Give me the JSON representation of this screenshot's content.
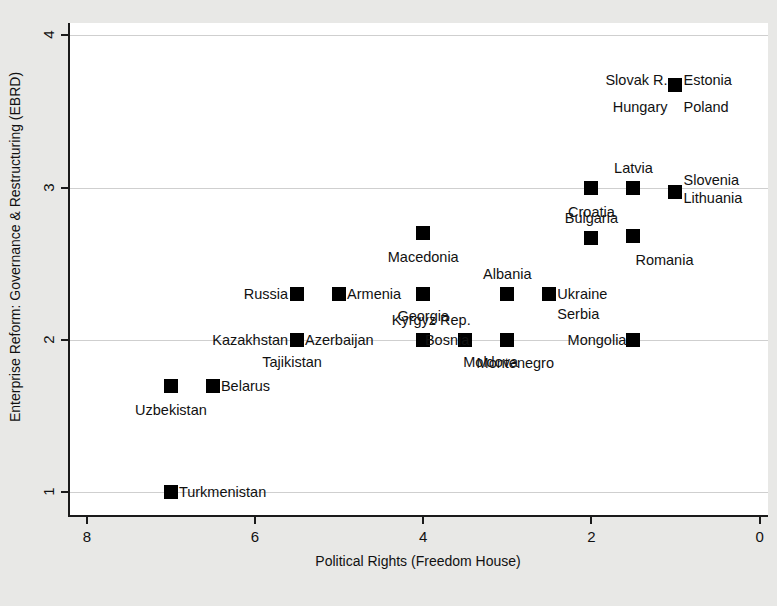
{
  "chart_data": {
    "type": "scatter",
    "title": "",
    "xlabel": "Political Rights (Freedom House)",
    "ylabel": "Enterprise Reform: Governance & Restructuring (EBRD)",
    "xlim": [
      8.2,
      -0.1
    ],
    "ylim": [
      0.85,
      4.08
    ],
    "x_reversed": true,
    "xticks": [
      8,
      6,
      4,
      2,
      0
    ],
    "xtick_labels": [
      "8",
      "6",
      "4",
      "2",
      "0"
    ],
    "yticks": [
      1,
      2,
      3,
      4
    ],
    "ytick_labels": [
      "1",
      "2",
      "3",
      "4"
    ],
    "grid": true,
    "grid_axis": "y",
    "legend": "none",
    "marker_shape": "square",
    "marker_color": "#000000",
    "points": [
      {
        "label": "",
        "x": 1.0,
        "y": 3.67,
        "labels_around": [
          {
            "text": "Slovak R.",
            "pos": "left",
            "dx": -8,
            "dy": -5
          },
          {
            "text": "Estonia",
            "pos": "right",
            "dx": 8,
            "dy": -5
          },
          {
            "text": "Hungary",
            "pos": "left",
            "dx": -8,
            "dy": 22
          },
          {
            "text": "Poland",
            "pos": "right",
            "dx": 8,
            "dy": 22
          }
        ]
      },
      {
        "label": "",
        "x": 2.0,
        "y": 3.0,
        "labels_around": [
          {
            "text": "Croatia",
            "pos": "center",
            "dx": 0,
            "dy": 24
          }
        ]
      },
      {
        "label": "",
        "x": 1.5,
        "y": 3.0,
        "labels_around": [
          {
            "text": "Latvia",
            "pos": "center",
            "dx": 0,
            "dy": -20
          }
        ]
      },
      {
        "label": "",
        "x": 1.0,
        "y": 2.97,
        "labels_around": [
          {
            "text": "Slovenia",
            "pos": "right",
            "dx": 8,
            "dy": -12
          },
          {
            "text": "Lithuania",
            "pos": "right",
            "dx": 8,
            "dy": 6
          }
        ]
      },
      {
        "label": "",
        "x": 2.0,
        "y": 2.67,
        "labels_around": [
          {
            "text": "Bulgaria",
            "pos": "center",
            "dx": 0,
            "dy": -20
          }
        ]
      },
      {
        "label": "",
        "x": 1.5,
        "y": 2.68,
        "labels_around": [
          {
            "text": "Romania",
            "pos": "right",
            "dx": 2,
            "dy": 24
          }
        ]
      },
      {
        "label": "",
        "x": 4.0,
        "y": 2.7,
        "labels_around": [
          {
            "text": "Macedonia",
            "pos": "center",
            "dx": 0,
            "dy": 24
          }
        ]
      },
      {
        "label": "",
        "x": 5.5,
        "y": 2.3,
        "labels_around": [
          {
            "text": "Russia",
            "pos": "left",
            "dx": -9,
            "dy": 0
          }
        ]
      },
      {
        "label": "",
        "x": 5.0,
        "y": 2.3,
        "labels_around": [
          {
            "text": "Armenia",
            "pos": "right",
            "dx": 8,
            "dy": 0
          }
        ]
      },
      {
        "label": "",
        "x": 4.0,
        "y": 2.3,
        "labels_around": [
          {
            "text": "Georgia",
            "pos": "center",
            "dx": 0,
            "dy": 22
          }
        ]
      },
      {
        "label": "",
        "x": 3.0,
        "y": 2.3,
        "labels_around": [
          {
            "text": "Albania",
            "pos": "center",
            "dx": 0,
            "dy": -20
          }
        ]
      },
      {
        "label": "",
        "x": 2.5,
        "y": 2.3,
        "labels_around": [
          {
            "text": "Ukraine",
            "pos": "right",
            "dx": 8,
            "dy": 0
          },
          {
            "text": "Serbia",
            "pos": "right",
            "dx": 8,
            "dy": 20
          }
        ]
      },
      {
        "label": "",
        "x": 5.5,
        "y": 2.0,
        "labels_around": [
          {
            "text": "Kazakhstan",
            "pos": "left",
            "dx": -9,
            "dy": 0
          },
          {
            "text": "Azerbaijan",
            "pos": "right",
            "dx": 8,
            "dy": 0
          },
          {
            "text": "Tajikistan",
            "pos": "center",
            "dx": -5,
            "dy": 22
          }
        ]
      },
      {
        "label": "",
        "x": 4.0,
        "y": 2.0,
        "labels_around": [
          {
            "text": "Kyrgyz Rep.",
            "pos": "center",
            "dx": 8,
            "dy": -20
          }
        ]
      },
      {
        "label": "",
        "x": 3.5,
        "y": 2.0,
        "labels_around": [
          {
            "text": "Bosnia",
            "pos": "left",
            "dx": 4,
            "dy": 0
          },
          {
            "text": "Moldova",
            "pos": "right",
            "dx": -2,
            "dy": 22
          }
        ]
      },
      {
        "label": "",
        "x": 3.0,
        "y": 2.0,
        "labels_around": [
          {
            "text": "Montenegro",
            "pos": "center",
            "dx": 8,
            "dy": 23
          }
        ]
      },
      {
        "label": "",
        "x": 1.5,
        "y": 2.0,
        "labels_around": [
          {
            "text": "Mongolia",
            "pos": "left",
            "dx": -7,
            "dy": 0
          }
        ]
      },
      {
        "label": "",
        "x": 7.0,
        "y": 1.7,
        "labels_around": [
          {
            "text": "Uzbekistan",
            "pos": "center",
            "dx": 0,
            "dy": 24
          }
        ]
      },
      {
        "label": "",
        "x": 6.5,
        "y": 1.7,
        "labels_around": [
          {
            "text": "Belarus",
            "pos": "right",
            "dx": 8,
            "dy": 0
          }
        ]
      },
      {
        "label": "",
        "x": 7.0,
        "y": 1.0,
        "labels_around": [
          {
            "text": "Turkmenistan",
            "pos": "right",
            "dx": 8,
            "dy": 0
          }
        ]
      }
    ],
    "countries": [
      "Slovak R.",
      "Estonia",
      "Hungary",
      "Poland",
      "Croatia",
      "Latvia",
      "Slovenia",
      "Lithuania",
      "Bulgaria",
      "Romania",
      "Macedonia",
      "Russia",
      "Armenia",
      "Georgia",
      "Albania",
      "Ukraine",
      "Serbia",
      "Kazakhstan",
      "Azerbaijan",
      "Tajikistan",
      "Kyrgyz Rep.",
      "Bosnia",
      "Moldova",
      "Montenegro",
      "Mongolia",
      "Uzbekistan",
      "Belarus",
      "Turkmenistan"
    ]
  },
  "colors": {
    "background": "#e8e8e6",
    "plot_background": "#ffffff",
    "axis": "#1a1a1a",
    "grid": "#cfcfcf",
    "marker": "#000000",
    "text": "#111111"
  }
}
